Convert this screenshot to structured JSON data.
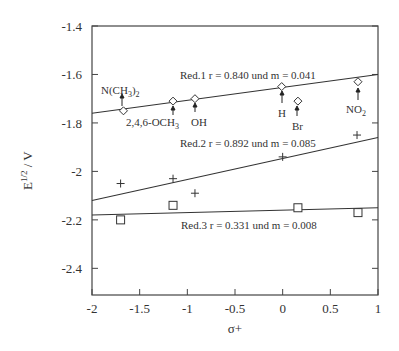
{
  "chart_data": {
    "type": "scatter",
    "title": "",
    "xlabel": "σ+",
    "ylabel": "E1/2 / V",
    "xlim": [
      -2,
      1
    ],
    "ylim": [
      -2.51,
      -1.4
    ],
    "grid": false,
    "x_ticks": [
      "-2",
      "-1.5",
      "-1",
      "-0.5",
      "0",
      "0.5",
      "1"
    ],
    "y_ticks": [
      "-1.4",
      "-1.6",
      "-1.8",
      "-2",
      "-2.2",
      "-2.4"
    ],
    "series": [
      {
        "name": "Red.1",
        "marker": "diamond",
        "annotation": "Red.1  r = 0.840 und m = 0.041",
        "points": [
          {
            "x": -1.67,
            "y": -1.75,
            "label": "N(CH3)2"
          },
          {
            "x": -1.15,
            "y": -1.71,
            "label": "2,4,6-OCH3"
          },
          {
            "x": -0.92,
            "y": -1.7,
            "label": "OH"
          },
          {
            "x": -0.01,
            "y": -1.65,
            "label": "H"
          },
          {
            "x": 0.16,
            "y": -1.71,
            "label": "Br"
          },
          {
            "x": 0.79,
            "y": -1.63,
            "label": "NO2"
          }
        ],
        "fit": {
          "x": [
            -2,
            1
          ],
          "y": [
            -1.76,
            -1.6
          ]
        }
      },
      {
        "name": "Red.2",
        "marker": "plus",
        "annotation": "Red.2  r = 0.892 und m = 0.085",
        "points": [
          {
            "x": -1.7,
            "y": -2.05
          },
          {
            "x": -1.15,
            "y": -2.03
          },
          {
            "x": -0.92,
            "y": -2.09
          },
          {
            "x": 0.0,
            "y": -1.94
          },
          {
            "x": 0.78,
            "y": -1.85
          }
        ],
        "fit": {
          "x": [
            -2,
            1
          ],
          "y": [
            -2.12,
            -1.86
          ]
        }
      },
      {
        "name": "Red.3",
        "marker": "square",
        "annotation": "Red.3  r = 0.331 und m = 0.008",
        "points": [
          {
            "x": -1.7,
            "y": -2.2
          },
          {
            "x": -1.15,
            "y": -2.14
          },
          {
            "x": 0.16,
            "y": -2.15
          },
          {
            "x": 0.79,
            "y": -2.17
          }
        ],
        "fit": {
          "x": [
            -2,
            1
          ],
          "y": [
            -2.18,
            -2.15
          ]
        }
      }
    ]
  },
  "labels": {
    "ylabel_main": "E",
    "ylabel_sup": "1/2",
    "ylabel_rest": " / V",
    "xlabel": "σ+",
    "ann1": "Red.1  r = 0.840 und m = 0.041",
    "ann2": "Red.2  r = 0.892 und m = 0.085",
    "ann3": "Red.3  r = 0.331 und m = 0.008",
    "sub_n": "N(CH",
    "sub_n_3": "3",
    "sub_n_close": ")",
    "sub_n_2": "2",
    "sub_och": "2,4,6-OCH",
    "sub_och_3": "3",
    "sub_oh": "OH",
    "sub_h": "H",
    "sub_br": "Br",
    "sub_no": "NO",
    "sub_no_2": "2"
  }
}
